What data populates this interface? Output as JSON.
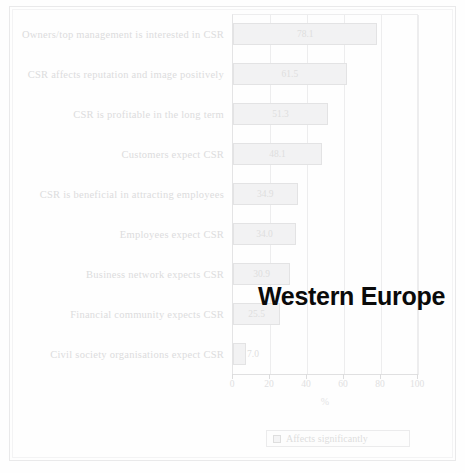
{
  "overlay": {
    "annotation": "Western Europe"
  },
  "legend": {
    "position": "bottom",
    "entries": [
      {
        "label": "Affects significantly",
        "swatch": "legend-swatch-icon"
      }
    ]
  },
  "axis": {
    "x_title": "%",
    "x_ticks": [
      "0",
      "20",
      "40",
      "60",
      "80",
      "100"
    ]
  },
  "chart_data": {
    "type": "bar",
    "orientation": "horizontal",
    "title": "Western Europe",
    "xlabel": "%",
    "ylabel": "",
    "xlim": [
      0,
      100
    ],
    "grid": true,
    "legend_position": "bottom",
    "series": [
      {
        "name": "Affects significantly",
        "values": [
          78.1,
          61.5,
          51.3,
          48.1,
          34.9,
          34.0,
          30.9,
          25.5,
          7.0
        ]
      }
    ],
    "categories": [
      "Owners/top management is interested in CSR",
      "CSR affects reputation and image positively",
      "CSR is profitable in the long term",
      "Customers expect CSR",
      "CSR is beneficial in attracting employees",
      "Employees expect CSR",
      "Business network expects CSR",
      "Financial community expects CSR",
      "Civil society organisations expect CSR"
    ],
    "data_labels": [
      "78.1",
      "61.5",
      "51.3",
      "48.1",
      "34.9",
      "34.0",
      "30.9",
      "25.5",
      "7.0"
    ],
    "tick_values": [
      0,
      20,
      40,
      60,
      80,
      100
    ]
  }
}
